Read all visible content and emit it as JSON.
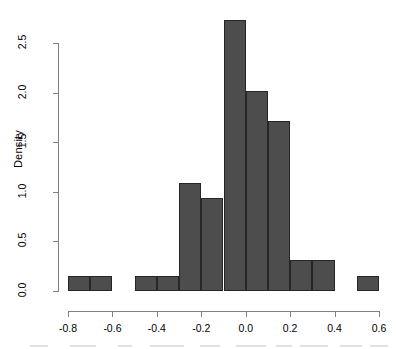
{
  "chart_data": {
    "type": "bar",
    "chart_subtype": "histogram",
    "title": "",
    "subtitle": "",
    "xlabel": "",
    "ylabel": "Density",
    "xlim": [
      -0.8,
      0.6
    ],
    "ylim": [
      0.0,
      2.75
    ],
    "grid": false,
    "legend": false,
    "bin_width": 0.1,
    "bar_color": "#4d4d4d",
    "bar_border_color": "#262626",
    "axis_color": "#808080",
    "x_ticks": [
      -0.8,
      -0.6,
      -0.4,
      -0.2,
      0.0,
      0.2,
      0.4,
      0.6
    ],
    "x_tick_labels": [
      "-0.8",
      "-0.6",
      "-0.4",
      "-0.2",
      "0.0",
      "0.2",
      "0.4",
      "0.6"
    ],
    "y_ticks": [
      0.0,
      0.5,
      1.0,
      1.5,
      2.0,
      2.5
    ],
    "y_tick_labels": [
      "0.0",
      "0.5",
      "1.0",
      "1.5",
      "2.0",
      "2.5"
    ],
    "bins": [
      {
        "x0": -0.8,
        "x1": -0.7,
        "density": 0.15
      },
      {
        "x0": -0.7,
        "x1": -0.6,
        "density": 0.15
      },
      {
        "x0": -0.6,
        "x1": -0.5,
        "density": 0.0
      },
      {
        "x0": -0.5,
        "x1": -0.4,
        "density": 0.15
      },
      {
        "x0": -0.4,
        "x1": -0.3,
        "density": 0.15
      },
      {
        "x0": -0.3,
        "x1": -0.2,
        "density": 1.09
      },
      {
        "x0": -0.2,
        "x1": -0.1,
        "density": 0.94
      },
      {
        "x0": -0.1,
        "x1": 0.0,
        "density": 2.73
      },
      {
        "x0": 0.0,
        "x1": 0.1,
        "density": 2.02
      },
      {
        "x0": 0.1,
        "x1": 0.2,
        "density": 1.71
      },
      {
        "x0": 0.2,
        "x1": 0.3,
        "density": 0.31
      },
      {
        "x0": 0.3,
        "x1": 0.4,
        "density": 0.31
      },
      {
        "x0": 0.4,
        "x1": 0.5,
        "density": 0.0
      },
      {
        "x0": 0.5,
        "x1": 0.6,
        "density": 0.15
      }
    ],
    "categories": [
      "-0.8--0.7",
      "-0.7--0.6",
      "-0.6--0.5",
      "-0.5--0.4",
      "-0.4--0.3",
      "-0.3--0.2",
      "-0.2--0.1",
      "-0.1-0.0",
      "0.0-0.1",
      "0.1-0.2",
      "0.2-0.3",
      "0.3-0.4",
      "0.4-0.5",
      "0.5-0.6"
    ],
    "values": [
      0.15,
      0.15,
      0.0,
      0.15,
      0.15,
      1.09,
      0.94,
      2.73,
      2.02,
      1.71,
      0.31,
      0.31,
      0.0,
      0.15
    ]
  },
  "axes": {
    "y_title": "Density"
  },
  "geometry": {
    "plot_left": 68,
    "plot_right": 379,
    "x_axis_y": 311,
    "y_axis_x": 58,
    "y_zero_y": 291,
    "y_top_y": 43,
    "y_top_value": 2.5
  }
}
